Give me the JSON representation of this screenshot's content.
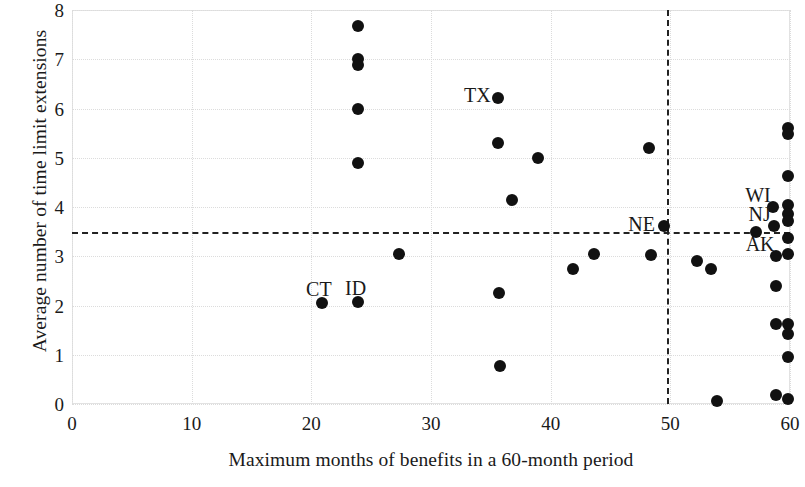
{
  "chart_data": {
    "type": "scatter",
    "title": "",
    "xlabel": "Maximum months of benefits in a 60-month period",
    "ylabel": "Average number of time limit extensions",
    "xlim": [
      0,
      60
    ],
    "ylim": [
      0,
      8
    ],
    "xticks": [
      "0",
      "10",
      "20",
      "30",
      "40",
      "50",
      "60"
    ],
    "xtick_values": [
      0,
      10,
      20,
      30,
      40,
      50,
      60
    ],
    "yticks": [
      "0",
      "1",
      "2",
      "3",
      "4",
      "5",
      "6",
      "7",
      "8"
    ],
    "ytick_values": [
      0,
      1,
      2,
      3,
      4,
      5,
      6,
      7,
      8
    ],
    "grid": true,
    "legend": "none",
    "marker": {
      "shape": "circle",
      "color": "#111111",
      "size": 12
    },
    "reference_lines": [
      {
        "orientation": "horizontal",
        "value": 3.5,
        "style": "dashed",
        "color": "#222222"
      },
      {
        "orientation": "vertical",
        "value": 49.7,
        "style": "dashed",
        "color": "#222222"
      }
    ],
    "points": [
      {
        "x": 20.9,
        "y": 2.05,
        "label": "CT"
      },
      {
        "x": 23.9,
        "y": 2.08,
        "label": "ID"
      },
      {
        "x": 23.9,
        "y": 7.68,
        "label": ""
      },
      {
        "x": 23.9,
        "y": 7.0,
        "label": ""
      },
      {
        "x": 23.9,
        "y": 6.88,
        "label": ""
      },
      {
        "x": 23.9,
        "y": 6.0,
        "label": ""
      },
      {
        "x": 23.9,
        "y": 4.9,
        "label": ""
      },
      {
        "x": 27.3,
        "y": 3.05,
        "label": ""
      },
      {
        "x": 35.6,
        "y": 5.3,
        "label": ""
      },
      {
        "x": 35.6,
        "y": 6.22,
        "label": "TX"
      },
      {
        "x": 35.7,
        "y": 2.25,
        "label": ""
      },
      {
        "x": 35.8,
        "y": 0.78,
        "label": ""
      },
      {
        "x": 36.8,
        "y": 4.15,
        "label": ""
      },
      {
        "x": 38.9,
        "y": 5.0,
        "label": ""
      },
      {
        "x": 41.9,
        "y": 2.75,
        "label": ""
      },
      {
        "x": 43.6,
        "y": 3.05,
        "label": ""
      },
      {
        "x": 48.2,
        "y": 5.2,
        "label": ""
      },
      {
        "x": 48.4,
        "y": 3.02,
        "label": ""
      },
      {
        "x": 49.5,
        "y": 3.62,
        "label": "NE"
      },
      {
        "x": 52.2,
        "y": 2.9,
        "label": ""
      },
      {
        "x": 53.4,
        "y": 2.75,
        "label": ""
      },
      {
        "x": 53.9,
        "y": 0.07,
        "label": ""
      },
      {
        "x": 57.2,
        "y": 3.5,
        "label": ""
      },
      {
        "x": 58.6,
        "y": 4.0,
        "label": "WI"
      },
      {
        "x": 58.7,
        "y": 3.62,
        "label": "NJ"
      },
      {
        "x": 58.8,
        "y": 3.0,
        "label": "AK"
      },
      {
        "x": 58.8,
        "y": 2.4,
        "label": ""
      },
      {
        "x": 58.8,
        "y": 1.62,
        "label": ""
      },
      {
        "x": 58.8,
        "y": 0.18,
        "label": ""
      },
      {
        "x": 59.8,
        "y": 5.6,
        "label": ""
      },
      {
        "x": 59.8,
        "y": 5.48,
        "label": ""
      },
      {
        "x": 59.8,
        "y": 4.62,
        "label": ""
      },
      {
        "x": 59.8,
        "y": 4.05,
        "label": ""
      },
      {
        "x": 59.8,
        "y": 3.85,
        "label": ""
      },
      {
        "x": 59.8,
        "y": 3.72,
        "label": ""
      },
      {
        "x": 59.8,
        "y": 3.38,
        "label": ""
      },
      {
        "x": 59.8,
        "y": 3.05,
        "label": ""
      },
      {
        "x": 59.8,
        "y": 1.62,
        "label": ""
      },
      {
        "x": 59.8,
        "y": 1.42,
        "label": ""
      },
      {
        "x": 59.8,
        "y": 0.95,
        "label": ""
      },
      {
        "x": 59.8,
        "y": 0.1,
        "label": ""
      }
    ],
    "point_labels": [
      {
        "text": "TX",
        "x": 35.6,
        "y": 6.22,
        "dx": -34,
        "dy": -3
      },
      {
        "text": "NE",
        "x": 49.5,
        "y": 3.62,
        "dx": -36,
        "dy": -2
      },
      {
        "text": "CT",
        "x": 20.9,
        "y": 2.05,
        "dx": -16,
        "dy": -14
      },
      {
        "text": "ID",
        "x": 23.9,
        "y": 2.08,
        "dx": -13,
        "dy": -14
      },
      {
        "text": "WI",
        "x": 58.6,
        "y": 4.0,
        "dx": -28,
        "dy": -12
      },
      {
        "text": "NJ",
        "x": 58.7,
        "y": 3.62,
        "dx": -26,
        "dy": -12
      },
      {
        "text": "AK",
        "x": 58.8,
        "y": 3.0,
        "dx": -30,
        "dy": -12
      }
    ]
  }
}
